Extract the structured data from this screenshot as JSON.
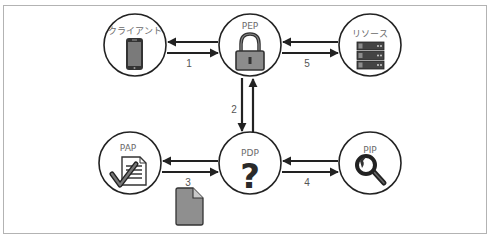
{
  "diagram": {
    "type": "access-control-architecture",
    "nodes": {
      "client": {
        "label": "クライアント",
        "icon": "smartphone-icon"
      },
      "pep": {
        "label": "PEP",
        "icon": "padlock-icon"
      },
      "resource": {
        "label": "リソース",
        "icon": "server-rack-icon"
      },
      "pap": {
        "label": "PAP",
        "icon": "document-check-icon"
      },
      "pdp": {
        "label": "PDP",
        "icon": "question-mark-icon",
        "glyph": "?"
      },
      "pip": {
        "label": "PIP",
        "icon": "magnifier-icon"
      }
    },
    "edges": [
      {
        "from": "client",
        "to": "pep",
        "label": "1",
        "bidirectional": true
      },
      {
        "from": "pep",
        "to": "pdp",
        "label": "2",
        "bidirectional": true
      },
      {
        "from": "pap",
        "to": "pdp",
        "label": "3",
        "bidirectional": true
      },
      {
        "from": "pdp",
        "to": "pip",
        "label": "4",
        "bidirectional": true
      },
      {
        "from": "pep",
        "to": "resource",
        "label": "5",
        "bidirectional": true
      }
    ],
    "annotations": {
      "policy_document": {
        "icon": "policy-document-icon",
        "near_edge": "3"
      }
    },
    "colors": {
      "stroke": "#222222",
      "icon_fill": "#8c8c8c",
      "icon_dark": "#333333",
      "frame": "#b3b3b3",
      "label_text": "#6a6a6a"
    }
  }
}
